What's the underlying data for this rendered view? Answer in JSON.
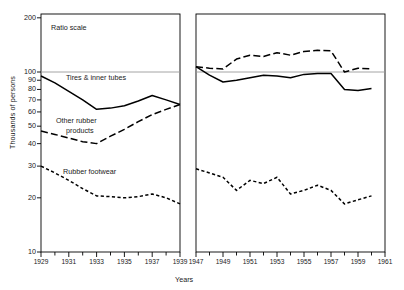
{
  "chart_data": {
    "type": "line",
    "title": "",
    "subtitle": "",
    "annotation": "Ratio scale",
    "xlabel": "Years",
    "ylabel": "Thousands of persons",
    "scale": "log",
    "grid": false,
    "legend_position": "inline-labels",
    "ylim": [
      10,
      200
    ],
    "yticks": [
      10,
      20,
      30,
      40,
      50,
      60,
      70,
      80,
      90,
      100,
      200
    ],
    "ytick_labels": [
      "10",
      "20",
      "30",
      "40",
      "50",
      "60",
      "70",
      "80",
      "90",
      "100",
      "200"
    ],
    "reference_line": 100,
    "panels": [
      {
        "name": "panel-left",
        "xlim": [
          1929,
          1939
        ],
        "xticks": [
          1929,
          1930,
          1931,
          1932,
          1933,
          1934,
          1935,
          1936,
          1937,
          1938,
          1939
        ],
        "xtick_labels": [
          "1929",
          "1931",
          "1933",
          "1935",
          "1937",
          "1939"
        ],
        "labeled_xticks": [
          1929,
          1931,
          1933,
          1935,
          1937,
          1939
        ],
        "x": [
          1929,
          1930,
          1931,
          1932,
          1933,
          1934,
          1935,
          1936,
          1937,
          1938,
          1939
        ],
        "series": [
          {
            "name": "Tires & inner tubes",
            "style": "solid",
            "values": [
              95,
              87,
              78,
              70,
              62,
              63,
              65,
              69,
              74,
              70,
              66
            ]
          },
          {
            "name": "Other rubber products",
            "style": "dashed-long",
            "values": [
              47,
              45,
              43,
              41,
              40,
              44,
              48,
              53,
              58,
              62,
              66
            ]
          },
          {
            "name": "Rubber footwear",
            "style": "dashed-short",
            "values": [
              30,
              27.5,
              25,
              22.5,
              20.5,
              20.3,
              20,
              20.3,
              21,
              20,
              18.5
            ]
          }
        ]
      },
      {
        "name": "panel-right",
        "xlim": [
          1947,
          1961
        ],
        "xticks": [
          1947,
          1948,
          1949,
          1950,
          1951,
          1952,
          1953,
          1954,
          1955,
          1956,
          1957,
          1958,
          1959,
          1960,
          1961
        ],
        "xtick_labels": [
          "1947",
          "1949",
          "1951",
          "1953",
          "1955",
          "1957",
          "1959",
          "1961"
        ],
        "labeled_xticks": [
          1947,
          1949,
          1951,
          1953,
          1955,
          1957,
          1959,
          1961
        ],
        "x": [
          1947,
          1948,
          1949,
          1950,
          1951,
          1952,
          1953,
          1954,
          1955,
          1956,
          1957,
          1958,
          1959,
          1960
        ],
        "series": [
          {
            "name": "Tires & inner tubes",
            "style": "solid",
            "values": [
              107,
              96,
              88,
              90,
              93,
              96,
              95,
              93,
              97,
              98,
              98,
              80,
              79,
              81
            ]
          },
          {
            "name": "Other rubber products",
            "style": "dashed-long",
            "values": [
              107,
              105,
              104,
              118,
              124,
              122,
              128,
              124,
              130,
              132,
              131,
              100,
              105,
              104
            ]
          },
          {
            "name": "Rubber footwear",
            "style": "dashed-short",
            "values": [
              29,
              27.5,
              26,
              22,
              25,
              24,
              26,
              21,
              22,
              23.5,
              22,
              18.5,
              19.5,
              20.5
            ]
          }
        ]
      }
    ]
  },
  "labels": {
    "ratio_scale": "Ratio scale",
    "tires": "Tires & inner tubes",
    "other_rubber_line1": "Other rubber",
    "other_rubber_line2": "products",
    "footwear": "Rubber footwear",
    "y_axis_title": "Thousands of persons",
    "x_axis_title": "Years"
  },
  "colors": {
    "line": "#000000",
    "axis": "#000000",
    "reference_line": "#9a9a9a",
    "background": "#ffffff",
    "text": "#1a1a1a"
  }
}
